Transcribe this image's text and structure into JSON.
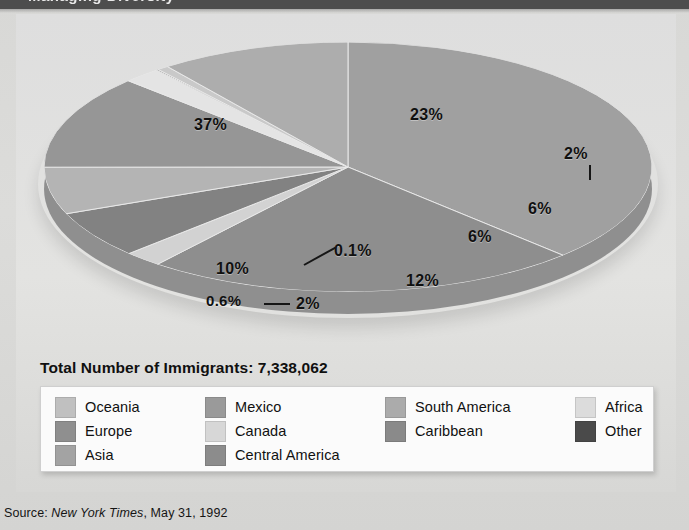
{
  "topbar": {
    "ghost_text": "Managing Diversity"
  },
  "chart": {
    "total_label": "Total Number of Immigrants: 7,338,062",
    "source_prefix": "Source: ",
    "source_publication": "New York Times",
    "source_suffix": ", May 31, 1992"
  },
  "chart_data": {
    "type": "pie",
    "title": "Total Number of Immigrants: 7,338,062",
    "subtitle": "",
    "total": "7,338,062",
    "total_value": 7338062,
    "units": "percent of immigrants",
    "legend_position": "bottom",
    "three_d": true,
    "labels": [
      "Asia",
      "Europe",
      "Oceania",
      "Caribbean",
      "South America",
      "Mexico",
      "Central America",
      "Other",
      "Africa",
      "Canada"
    ],
    "values": [
      37,
      23,
      2,
      6,
      6,
      12,
      2,
      0.1,
      0.6,
      10
    ],
    "value_labels": [
      "37%",
      "23%",
      "2%",
      "6%",
      "6%",
      "12%",
      "2%",
      "0.1%",
      "0.6%",
      "10%"
    ],
    "colors": [
      "#a0a0a0",
      "#8e8e8e",
      "#d2d2d2",
      "#828282",
      "#b4b4b4",
      "#969696",
      "#e4e4e4",
      "#4f4f4f",
      "#c9c9c9",
      "#adadad"
    ],
    "slices": [
      {
        "name": "Asia",
        "value": 37,
        "label": "37%",
        "color": "#a0a0a0"
      },
      {
        "name": "Europe",
        "value": 23,
        "label": "23%",
        "color": "#8e8e8e"
      },
      {
        "name": "Oceania",
        "value": 2,
        "label": "2%",
        "color": "#d2d2d2"
      },
      {
        "name": "Caribbean",
        "value": 6,
        "label": "6%",
        "color": "#828282"
      },
      {
        "name": "South America",
        "value": 6,
        "label": "6%",
        "color": "#b4b4b4"
      },
      {
        "name": "Mexico",
        "value": 12,
        "label": "12%",
        "color": "#969696"
      },
      {
        "name": "Central America",
        "value": 2,
        "label": "2%",
        "color": "#e4e4e4"
      },
      {
        "name": "Other",
        "value": 0.1,
        "label": "0.1%",
        "color": "#4f4f4f"
      },
      {
        "name": "Africa",
        "value": 0.6,
        "label": "0.6%",
        "color": "#c9c9c9"
      },
      {
        "name": "Canada",
        "value": 10,
        "label": "10%",
        "color": "#adadad"
      }
    ]
  },
  "slice_labels": {
    "asia": "37%",
    "europe": "23%",
    "oceania": "2%",
    "caribbean": "6%",
    "south_america": "6%",
    "mexico": "12%",
    "other": "0.1%",
    "africa": "0.6%",
    "central_america": "2%",
    "canada": "10%"
  },
  "legend": {
    "items": [
      {
        "label": "Oceania",
        "color": "#c0c0c0"
      },
      {
        "label": "Mexico",
        "color": "#9a9a9a"
      },
      {
        "label": "South America",
        "color": "#ababab"
      },
      {
        "label": "Africa",
        "color": "#dcdcdc"
      },
      {
        "label": "Europe",
        "color": "#8f8f8f"
      },
      {
        "label": "Canada",
        "color": "#d7d7d7"
      },
      {
        "label": "Caribbean",
        "color": "#8a8a8a"
      },
      {
        "label": "Other",
        "color": "#4a4a4a"
      },
      {
        "label": "Asia",
        "color": "#a3a3a3"
      },
      {
        "label": "Central America",
        "color": "#8c8c8c"
      }
    ]
  }
}
